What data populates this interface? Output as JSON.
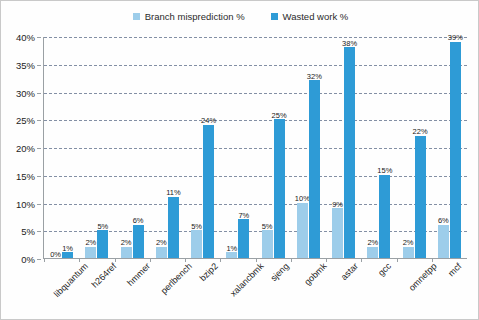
{
  "chart_data": {
    "type": "bar",
    "title": "",
    "subtitle": "",
    "xlabel": "",
    "ylabel": "",
    "ylim": [
      0,
      40
    ],
    "ytick_labels": [
      "0%",
      "5%",
      "10%",
      "15%",
      "20%",
      "25%",
      "30%",
      "35%",
      "40%"
    ],
    "ytick_values": [
      0,
      5,
      10,
      15,
      20,
      25,
      30,
      35,
      40
    ],
    "grid": true,
    "legend_position": "top-center",
    "value_suffix": "%",
    "categories": [
      "libquantum",
      "h264ref",
      "hmmer",
      "perlbench",
      "bzip2",
      "xalancbmk",
      "sjeng",
      "gobmk",
      "astar",
      "gcc",
      "omnetpp",
      "mcf"
    ],
    "series": [
      {
        "name": "Branch misprediction %",
        "color": "#9dcdea",
        "values": [
          0,
          2,
          2,
          2,
          5,
          1,
          5,
          10,
          9,
          2,
          2,
          6
        ],
        "labels": [
          "0%",
          "2%",
          "2%",
          "2%",
          "5%",
          "1%",
          "5%",
          "10%",
          "9%",
          "2%",
          "2%",
          "6%"
        ]
      },
      {
        "name": "Wasted work %",
        "color": "#2e9bd6",
        "values": [
          1,
          5,
          6,
          11,
          24,
          7,
          25,
          32,
          38,
          15,
          22,
          39
        ],
        "labels": [
          "1%",
          "5%",
          "6%",
          "11%",
          "24%",
          "7%",
          "25%",
          "32%",
          "38%",
          "15%",
          "22%",
          "39%"
        ]
      }
    ]
  },
  "colors": {
    "series_light": "#9dcdea",
    "series_dark": "#2e9bd6",
    "gridline": "#5a6b86",
    "axis": "#9aa0a4",
    "background": "#fefefe",
    "text": "#231f20"
  }
}
